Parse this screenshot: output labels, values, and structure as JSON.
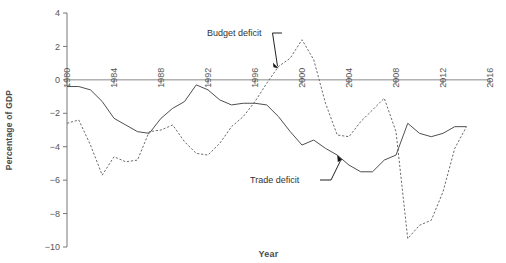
{
  "chart_data": {
    "type": "line",
    "title": "",
    "xlabel": "Year",
    "ylabel": "Percentage of GDP",
    "xlim": [
      1980,
      2016
    ],
    "ylim": [
      -10,
      4
    ],
    "xticks": [
      1980,
      1984,
      1988,
      1992,
      1996,
      2000,
      2004,
      2008,
      2012,
      2016
    ],
    "xticklabels": [
      "1980",
      "1984",
      "1988",
      "1992",
      "1996",
      "2000",
      "2004",
      "2008",
      "2012",
      "2016"
    ],
    "yticks": [
      4,
      2,
      0,
      -2,
      -4,
      -6,
      -8,
      -10
    ],
    "yticklabels": [
      "4",
      "2",
      "0",
      "-2",
      "-4",
      "-6",
      "-8",
      "-10"
    ],
    "grid": false,
    "legend": "annotations",
    "zero_reference_line": true,
    "series": [
      {
        "name": "Budget deficit",
        "style": "dashed",
        "color": "#6a6a6a",
        "x": [
          1980,
          1981,
          1982,
          1983,
          1984,
          1985,
          1986,
          1987,
          1988,
          1989,
          1990,
          1991,
          1992,
          1993,
          1994,
          1995,
          1996,
          1997,
          1998,
          1999,
          2000,
          2001,
          2002,
          2003,
          2004,
          2005,
          2006,
          2007,
          2008,
          2009,
          2010,
          2011,
          2012,
          2013,
          2014
        ],
        "values": [
          -2.6,
          -2.4,
          -3.9,
          -5.7,
          -4.6,
          -4.9,
          -4.8,
          -3.1,
          -3.0,
          -2.7,
          -3.7,
          -4.4,
          -4.5,
          -3.8,
          -2.8,
          -2.2,
          -1.3,
          -0.2,
          0.8,
          1.3,
          2.4,
          1.2,
          -1.4,
          -3.3,
          -3.4,
          -2.5,
          -1.8,
          -1.1,
          -3.1,
          -9.5,
          -8.7,
          -8.4,
          -6.7,
          -4.1,
          -2.8
        ]
      },
      {
        "name": "Trade deficit",
        "style": "solid",
        "color": "#4f4f4f",
        "x": [
          1980,
          1981,
          1982,
          1983,
          1984,
          1985,
          1986,
          1987,
          1988,
          1989,
          1990,
          1991,
          1992,
          1993,
          1994,
          1995,
          1996,
          1997,
          1998,
          1999,
          2000,
          2001,
          2002,
          2003,
          2004,
          2005,
          2006,
          2007,
          2008,
          2009,
          2010,
          2011,
          2012,
          2013,
          2014
        ],
        "values": [
          -0.4,
          -0.4,
          -0.6,
          -1.3,
          -2.3,
          -2.7,
          -3.1,
          -3.2,
          -2.3,
          -1.7,
          -1.3,
          -0.3,
          -0.6,
          -1.2,
          -1.5,
          -1.4,
          -1.4,
          -1.5,
          -2.2,
          -3.1,
          -3.9,
          -3.6,
          -4.1,
          -4.5,
          -5.1,
          -5.5,
          -5.5,
          -4.8,
          -4.5,
          -2.6,
          -3.2,
          -3.4,
          -3.2,
          -2.8,
          -2.8
        ]
      }
    ],
    "annotations": [
      {
        "text": "Budget deficit",
        "points_to_year": 1998,
        "points_to_value": 0.7
      },
      {
        "text": "Trade deficit",
        "points_to_year": 2003,
        "points_to_value": -4.5
      }
    ]
  }
}
